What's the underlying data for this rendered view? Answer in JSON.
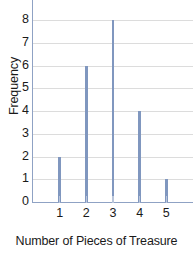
{
  "chart_data": {
    "type": "bar",
    "title": "",
    "xlabel": "Number of Pieces of Treasure",
    "ylabel": "Frequency",
    "categories": [
      "1",
      "2",
      "3",
      "4",
      "5"
    ],
    "values": [
      2,
      6,
      8,
      4,
      1
    ],
    "series": [
      {
        "name": "Frequency",
        "values": [
          2,
          6,
          8,
          4,
          1
        ]
      }
    ],
    "xlim": [
      0,
      6
    ],
    "ylim": [
      0,
      8
    ],
    "y_ticks": [
      "0",
      "1",
      "2",
      "3",
      "4",
      "5",
      "6",
      "7",
      "8"
    ],
    "x_ticks": [
      "1",
      "2",
      "3",
      "4",
      "5"
    ],
    "grid": "horizontal",
    "legend": "none",
    "bar_color": "#8097bf",
    "gridline_color": "#dcdcdc",
    "axis_color": "#8fa2c4",
    "text_color": "#1a1a1a",
    "background_color": "#ffffff"
  }
}
